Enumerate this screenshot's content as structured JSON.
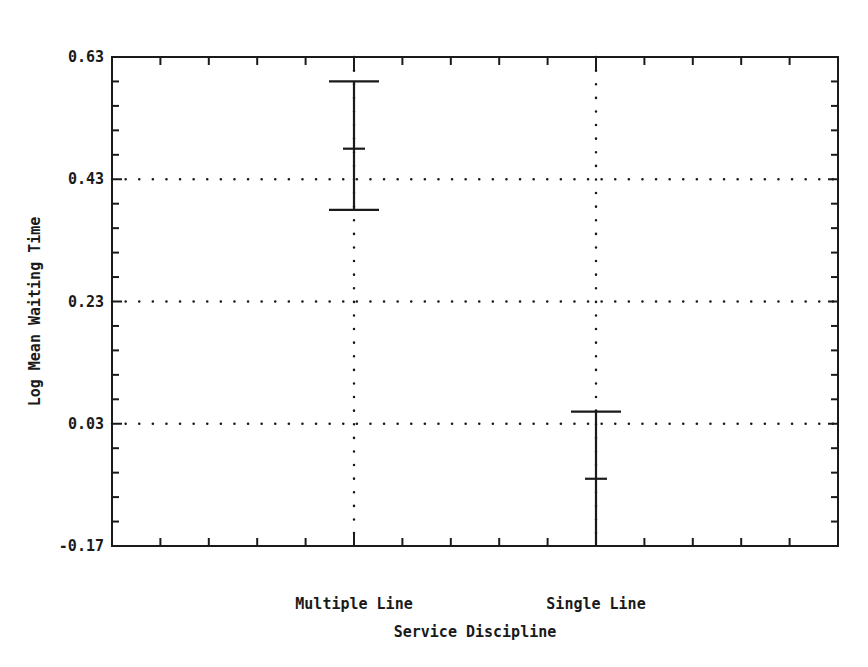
{
  "chart_data": {
    "type": "errorbar",
    "title": "",
    "xlabel": "Service Discipline",
    "ylabel": "Log Mean Waiting Time",
    "categories": [
      "Multiple Line",
      "Single Line"
    ],
    "series": [
      {
        "name": "Log Mean Waiting Time",
        "mean": [
          0.48,
          -0.06
        ],
        "upper": [
          0.59,
          0.05
        ],
        "lower": [
          0.38,
          -0.17
        ]
      }
    ],
    "ylim": [
      -0.17,
      0.63
    ],
    "yticks": [
      0.63,
      0.43,
      0.23,
      0.03,
      -0.17
    ],
    "ytick_labels": [
      "0.63",
      "0.43",
      "0.23",
      "0.03",
      "-0.17"
    ],
    "grid": "dotted, at y-ticks 0.43/0.23/0.03 and at category x positions",
    "legend": "none"
  },
  "colors": {
    "ink": "#1a1a1a",
    "background": "#ffffff"
  }
}
